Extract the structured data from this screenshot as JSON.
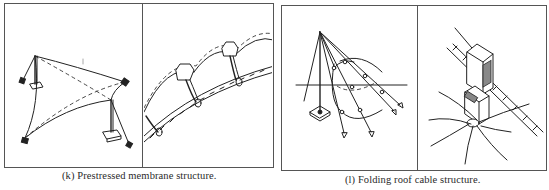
{
  "figures": [
    {
      "id": "k",
      "caption": "(k)  Prestressed membrane structure.",
      "panels": [
        {
          "illustration": "four-point tensile membrane with masts, guy cables and anchor blocks"
        },
        {
          "illustration": "close-up of membrane arches clamped to a twisted edge cable with loop fittings"
        }
      ]
    },
    {
      "id": "l",
      "caption": "(l)  Folding roof cable structure.",
      "panels": [
        {
          "illustration": "mast with fan of radiating cables and folding roof membrane"
        },
        {
          "illustration": "detail of cable clamp fitting on a twisted cable with radiating membrane lines"
        }
      ]
    }
  ],
  "colors": {
    "ink": "#222222",
    "frame": "#555555",
    "background": "#ffffff"
  }
}
